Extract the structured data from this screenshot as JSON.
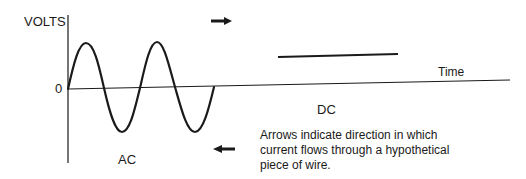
{
  "diagram": {
    "y_axis_label": "VOLTS",
    "zero_label": "0",
    "x_axis_label": "Time",
    "ac_label": "AC",
    "dc_label": "DC",
    "caption_lines": [
      "Arrows indicate direction in which",
      "current flows through a hypothetical",
      "piece of wire."
    ],
    "arrows": [
      {
        "name": "right-arrow",
        "direction": "right"
      },
      {
        "name": "left-arrow",
        "direction": "left"
      }
    ],
    "colors": {
      "line": "#1a1a1a",
      "background": "#ffffff"
    }
  }
}
